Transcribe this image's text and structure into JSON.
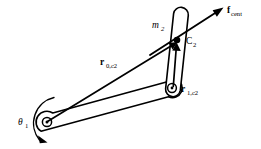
{
  "figure": {
    "background_color": "#ffffff",
    "stroke_color": "#000000",
    "width": 261,
    "height": 149
  },
  "labels": {
    "mass_link2": {
      "symbol": "m",
      "subscript": "2",
      "full": "m2"
    },
    "com_point": {
      "symbol": "C",
      "subscript": "2",
      "full": "C2"
    },
    "vector_base_to_com": {
      "symbol": "r",
      "subscript": "0,c2",
      "full": "r0,c2"
    },
    "vector_elbow_to_com": {
      "symbol": "r",
      "subscript": "1,c2",
      "full": "r1,c2"
    },
    "centrifugal_force": {
      "symbol": "f",
      "subscript": "cent",
      "full": "fcent"
    },
    "joint_angle": {
      "symbol": "θ",
      "subscript": "1",
      "full": "θ1"
    }
  },
  "geometry": {
    "base_joint": {
      "x": 47,
      "y": 122,
      "name": "revolute-joint-0"
    },
    "elbow_joint": {
      "x": 172,
      "y": 88,
      "name": "revolute-joint-1"
    },
    "link2_tip": {
      "x": 181,
      "y": 13,
      "name": "link-2-tip"
    },
    "center_of_mass_2": {
      "x": 177,
      "y": 40,
      "name": "center-of-mass-link-2"
    },
    "force_arrow_tip": {
      "x": 223,
      "y": 8,
      "name": "f-cent-arrow-tip"
    },
    "force_arrow_tail": {
      "x": 150,
      "y": 55,
      "name": "f-cent-arrow-tail"
    }
  },
  "elements": {
    "link1_name": "link-1",
    "link2_name": "link-2",
    "rotation_arc_name": "theta-1-rotation-arc"
  }
}
